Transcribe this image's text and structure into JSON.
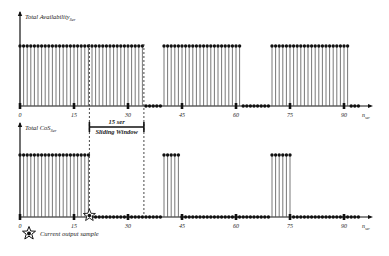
{
  "top_plot": {
    "ylabel": "Total Availability",
    "ylabel_sub": "Ser",
    "xlabel": "n",
    "xlabel_sub": "ser",
    "ticks": [
      "0",
      "15",
      "30",
      "45",
      "60",
      "75",
      "90"
    ]
  },
  "bottom_plot": {
    "ylabel": "Total CoS",
    "ylabel_sub": "Ser",
    "xlabel": "n",
    "xlabel_sub": "ser",
    "ticks": [
      "0",
      "15",
      "30",
      "45",
      "60",
      "75",
      "90"
    ]
  },
  "window": {
    "line1": "15 ser",
    "line2": "Sliding Window"
  },
  "legend": {
    "label": "Current output sample",
    "icon": "star-icon"
  },
  "chart_data": [
    {
      "type": "stem",
      "title": "Total Availability_Ser",
      "xlabel": "n_ser",
      "x_range": [
        0,
        95
      ],
      "high_ranges": [
        [
          0,
          34
        ],
        [
          40,
          61
        ],
        [
          70,
          91
        ]
      ],
      "levels": {
        "low": 0,
        "high": 1
      }
    },
    {
      "type": "stem",
      "title": "Total CoS_Ser",
      "xlabel": "n_ser",
      "x_range": [
        0,
        95
      ],
      "high_ranges": [
        [
          0,
          19
        ],
        [
          40,
          44
        ],
        [
          70,
          75
        ]
      ],
      "levels": {
        "low": 0,
        "high": 1
      },
      "current_output_sample": 19,
      "sliding_window": {
        "start": 19,
        "end": 34,
        "length": "15 ser"
      }
    }
  ]
}
